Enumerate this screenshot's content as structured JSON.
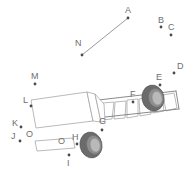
{
  "figure": {
    "type": "technical-line-drawing",
    "background_color": "#ffffff",
    "line_color": "#9a9a9a",
    "label_color": "#6e6e6e",
    "marker_color": "#4a4a4a",
    "tire_color": "#6b6b6b",
    "hub_color": "#b9b9b9"
  },
  "labels": [
    {
      "id": "A",
      "text": "A",
      "text_x": 125,
      "text_y": 13,
      "dot_x": 128,
      "dot_y": 18
    },
    {
      "id": "B",
      "text": "B",
      "text_x": 158,
      "text_y": 23,
      "dot_x": 161,
      "dot_y": 27
    },
    {
      "id": "C",
      "text": "C",
      "text_x": 168,
      "text_y": 30,
      "dot_x": 171,
      "dot_y": 35
    },
    {
      "id": "D",
      "text": "D",
      "text_x": 177,
      "text_y": 69,
      "dot_x": 174,
      "dot_y": 73
    },
    {
      "id": "E",
      "text": "E",
      "text_x": 156,
      "text_y": 80,
      "dot_x": 160,
      "dot_y": 85
    },
    {
      "id": "F",
      "text": "F",
      "text_x": 130,
      "text_y": 97,
      "dot_x": 133,
      "dot_y": 102
    },
    {
      "id": "G",
      "text": "G",
      "text_x": 99,
      "text_y": 124,
      "dot_x": 102,
      "dot_y": 130
    },
    {
      "id": "H",
      "text": "H",
      "text_x": 72,
      "text_y": 140,
      "dot_x": 77,
      "dot_y": 144
    },
    {
      "id": "I",
      "text": "I",
      "text_x": 67,
      "text_y": 166,
      "dot_x": 69,
      "dot_y": 155
    },
    {
      "id": "J",
      "text": "J",
      "text_x": 11,
      "text_y": 139,
      "dot_x": 20,
      "dot_y": 141
    },
    {
      "id": "K",
      "text": "K",
      "text_x": 12,
      "text_y": 126,
      "dot_x": 21,
      "dot_y": 127
    },
    {
      "id": "L",
      "text": "L",
      "text_x": 23,
      "text_y": 103,
      "dot_x": 31,
      "dot_y": 106
    },
    {
      "id": "M",
      "text": "M",
      "text_x": 31,
      "text_y": 79,
      "dot_x": 35,
      "dot_y": 84
    },
    {
      "id": "N",
      "text": "N",
      "text_x": 75,
      "text_y": 46,
      "dot_x": 82,
      "dot_y": 55
    },
    {
      "id": "O1",
      "text": "O",
      "text_x": 26,
      "text_y": 137,
      "dot_x": null,
      "dot_y": null
    },
    {
      "id": "O2",
      "text": "O",
      "text_x": 58,
      "text_y": 144,
      "dot_x": null,
      "dot_y": null
    }
  ],
  "leader_lines": [
    {
      "id": "N-to-A",
      "x1": 82,
      "y1": 55,
      "x2": 128,
      "y2": 18
    }
  ],
  "trailer": {
    "panel_count": 9,
    "panels": [
      {
        "points": "62,120 73,121 78,106 67,105"
      },
      {
        "points": "75,121 86,121 90,105 79,105"
      },
      {
        "points": "88,121 99,120 102,104 91,104"
      },
      {
        "points": "101,120 112,119 114,102 103,103"
      },
      {
        "points": "114,119 125,118 126,101 115,102"
      },
      {
        "points": "127,118 138,116 138,99 127,100"
      },
      {
        "points": "140,116 151,114 150,97 139,99"
      },
      {
        "points": "153,113 164,111 162,95 151,97"
      },
      {
        "points": "166,111 177,108 174,93 163,95"
      }
    ],
    "top_edge": "67,104 176,92",
    "bottom_edge": "61,121 178,108",
    "rear_edge": "176,92 178,108"
  },
  "cab": {
    "body_outline": "31,100 87,92 93,120 36,127",
    "nose_panel": "87,92 93,120 99,122 95,94",
    "connector": "93,120 101,121 104,105 95,94"
  },
  "bumper": {
    "outline": "35,141 73,138 75,148 37,151"
  },
  "wheels": [
    {
      "id": "rear-wheel",
      "cx": 153,
      "cy": 98,
      "rx": 11,
      "ry": 13,
      "hub_cx": 157,
      "hub_cy": 99,
      "hub_rx": 5,
      "hub_ry": 7,
      "rotation": -12
    },
    {
      "id": "front-wheel",
      "cx": 91,
      "cy": 145,
      "rx": 11,
      "ry": 13,
      "hub_cx": 95,
      "hub_cy": 146,
      "hub_rx": 5,
      "hub_ry": 7,
      "rotation": -12
    }
  ]
}
